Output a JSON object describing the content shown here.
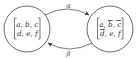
{
  "diagram": {
    "type": "state-transition",
    "nodes": [
      {
        "id": "left",
        "row1": "a, b, c",
        "row2": "d, e, f",
        "overlined": []
      },
      {
        "id": "right",
        "row1_parts": [
          "a, ",
          "b",
          ", ",
          "c"
        ],
        "row2_parts": [
          "d",
          ", e, f"
        ],
        "overlined": [
          "b",
          "c",
          "d"
        ]
      }
    ],
    "edges": [
      {
        "from": "left",
        "to": "right",
        "label": "α",
        "position": "top"
      },
      {
        "from": "right",
        "to": "left",
        "label": "β",
        "position": "bottom"
      }
    ]
  },
  "colors": {
    "stroke": "#555555",
    "text": "#333333",
    "background": "#ffffff"
  }
}
